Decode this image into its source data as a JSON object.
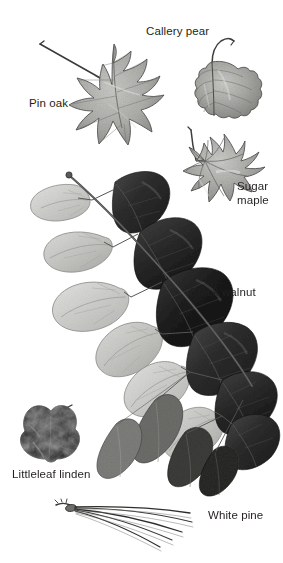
{
  "plate": {
    "title": "Tree leaf identification plate",
    "background_color": "#ffffff",
    "ink_color": "#231f20",
    "width": 283,
    "height": 563,
    "medium": "grayscale scanned leaf photographs"
  },
  "labels": {
    "callery_pear": "Callery pear",
    "pin_oak": "Pin oak",
    "sugar_maple": "Sugar\nmaple",
    "black_walnut": "Black walnut",
    "littleleaf_linden": "Littleleaf linden",
    "white_pine": "White pine"
  },
  "specimens": [
    {
      "name": "Pin oak",
      "label_key": "pin_oak",
      "leaf_type": "simple, deeply pinnately lobed with bristle-tipped lobes",
      "tone": "medium gray",
      "position": "upper left",
      "has_twig": true
    },
    {
      "name": "Callery pear",
      "label_key": "callery_pear",
      "leaf_type": "simple, broadly ovate with wavy (crenate) margin",
      "tone": "medium gray",
      "position": "upper right",
      "has_twig": true
    },
    {
      "name": "Sugar maple",
      "label_key": "sugar_maple",
      "leaf_type": "simple, palmately 5-lobed",
      "tone": "medium gray",
      "position": "upper right, below Callery pear",
      "has_twig": true
    },
    {
      "name": "Black walnut",
      "label_key": "black_walnut",
      "leaf_type": "pinnately compound with many paired leaflets on a long rachis",
      "tone": "pale gray leaflets on the left of the rachis, very dark leaflets on the right",
      "position": "center, spanning the plate diagonally",
      "has_twig": true,
      "leaflet_pairs": 7
    },
    {
      "name": "Littleleaf linden",
      "label_key": "littleleaf_linden",
      "leaf_type": "simple, heart-shaped (cordate) with serrate margin",
      "tone": "very dark, nearly black",
      "position": "lower left",
      "has_twig": true
    },
    {
      "name": "White pine",
      "label_key": "white_pine",
      "leaf_type": "fascicle of five slender needles",
      "tone": "dark gray outlines",
      "position": "bottom",
      "has_twig": true,
      "needle_count": 5
    }
  ]
}
